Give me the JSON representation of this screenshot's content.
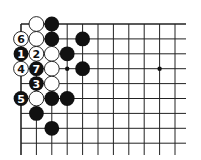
{
  "diagram": {
    "type": "go-board-corner",
    "grid": {
      "origin_x": 21,
      "origin_y": 24,
      "spacing_x": 15.4,
      "spacing_y": 14.9,
      "cols": 11,
      "rows": 9,
      "right_end_x": 186,
      "bottom_end_y": 155,
      "line_color": "#222222"
    },
    "star_points": [
      {
        "col": 3,
        "row": 3
      },
      {
        "col": 9,
        "row": 3
      }
    ],
    "stones": [
      {
        "col": 1,
        "row": 0,
        "color": "white",
        "label": ""
      },
      {
        "col": 2,
        "row": 0,
        "color": "black",
        "label": ""
      },
      {
        "col": 0,
        "row": 1,
        "color": "white",
        "label": "6"
      },
      {
        "col": 1,
        "row": 1,
        "color": "white",
        "label": ""
      },
      {
        "col": 2,
        "row": 1,
        "color": "black",
        "label": ""
      },
      {
        "col": 4,
        "row": 1,
        "color": "black",
        "label": ""
      },
      {
        "col": 0,
        "row": 2,
        "color": "black",
        "label": "1"
      },
      {
        "col": 1,
        "row": 2,
        "color": "white",
        "label": "2"
      },
      {
        "col": 2,
        "row": 2,
        "color": "white",
        "label": ""
      },
      {
        "col": 3,
        "row": 2,
        "color": "black",
        "label": ""
      },
      {
        "col": 0,
        "row": 3,
        "color": "white",
        "label": "4"
      },
      {
        "col": 1,
        "row": 3,
        "color": "black",
        "label": "7"
      },
      {
        "col": 2,
        "row": 3,
        "color": "white",
        "label": ""
      },
      {
        "col": 4,
        "row": 3,
        "color": "black",
        "label": ""
      },
      {
        "col": 1,
        "row": 4,
        "color": "black",
        "label": "3"
      },
      {
        "col": 2,
        "row": 4,
        "color": "white",
        "label": ""
      },
      {
        "col": 0,
        "row": 5,
        "color": "black",
        "label": "5"
      },
      {
        "col": 1,
        "row": 5,
        "color": "white",
        "label": ""
      },
      {
        "col": 2,
        "row": 5,
        "color": "black",
        "label": ""
      },
      {
        "col": 3,
        "row": 5,
        "color": "black",
        "label": ""
      },
      {
        "col": 1,
        "row": 6,
        "color": "black",
        "label": ""
      },
      {
        "col": 2,
        "row": 7,
        "color": "black",
        "label": ""
      }
    ]
  }
}
